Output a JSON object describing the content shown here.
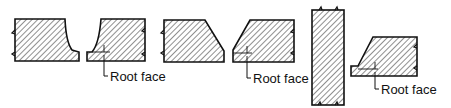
{
  "diagram": {
    "labels": {
      "root_face_1": "Root face",
      "root_face_2": "Root face",
      "root_face_3": "Root face"
    },
    "colors": {
      "stroke": "#111111",
      "hatch": "#333333",
      "background": "#ffffff"
    },
    "shapes": [
      {
        "name": "j-groove-left",
        "type": "J-groove plate"
      },
      {
        "name": "j-groove-right",
        "type": "J-groove plate with root face"
      },
      {
        "name": "bevel-left",
        "type": "bevel plate"
      },
      {
        "name": "bevel-right",
        "type": "bevel plate with root face"
      },
      {
        "name": "vertical-plate",
        "type": "square plate"
      },
      {
        "name": "bevel-tee",
        "type": "bevel plate with root face"
      }
    ]
  }
}
